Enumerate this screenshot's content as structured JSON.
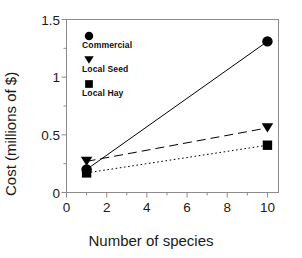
{
  "chart_data": {
    "type": "line",
    "title": "",
    "xlabel": "Number of species",
    "ylabel": "Cost (millions of $)",
    "xlim": [
      0,
      10.55
    ],
    "ylim": [
      0,
      1.5
    ],
    "grid": false,
    "legend_position": "upper-left-inside",
    "x": [
      1,
      10
    ],
    "series": [
      {
        "name": "Commercial",
        "marker": "circle",
        "linestyle": "solid",
        "color": "#000000",
        "values": [
          0.2,
          1.31
        ]
      },
      {
        "name": "Local Seed",
        "marker": "triangle-down",
        "linestyle": "dashed",
        "color": "#000000",
        "values": [
          0.27,
          0.56
        ]
      },
      {
        "name": "Local Hay",
        "marker": "square",
        "linestyle": "dotted",
        "color": "#000000",
        "values": [
          0.17,
          0.41
        ]
      }
    ],
    "xticks": [
      0,
      2,
      4,
      6,
      8,
      10
    ],
    "xtick_labels": [
      "0",
      "2",
      "4",
      "6",
      "8",
      "10"
    ],
    "xminor_ticks": [
      1,
      3,
      5,
      7,
      9
    ],
    "yticks": [
      0,
      0.5,
      1,
      1.5
    ],
    "ytick_labels": [
      "0",
      "0.5",
      "1",
      "1.5"
    ],
    "yminor_ticks": [
      0.25,
      0.75,
      1.25
    ]
  },
  "legend": {
    "entries": [
      {
        "label": "Commercial",
        "marker": "circle-marker"
      },
      {
        "label": "Local Seed",
        "marker": "triangle-down-marker"
      },
      {
        "label": "Local Hay",
        "marker": "square-marker"
      }
    ]
  },
  "axes": {
    "x_title": "Number of species",
    "y_title": "Cost (millions of $)",
    "xtick_labels": [
      "0",
      "2",
      "4",
      "6",
      "8",
      "10"
    ],
    "ytick_labels": [
      "0",
      "0.5",
      "1",
      "1.5"
    ]
  },
  "colors": {
    "ink": "#000000",
    "axis": "#8c8c8c",
    "background": "#ffffff"
  }
}
